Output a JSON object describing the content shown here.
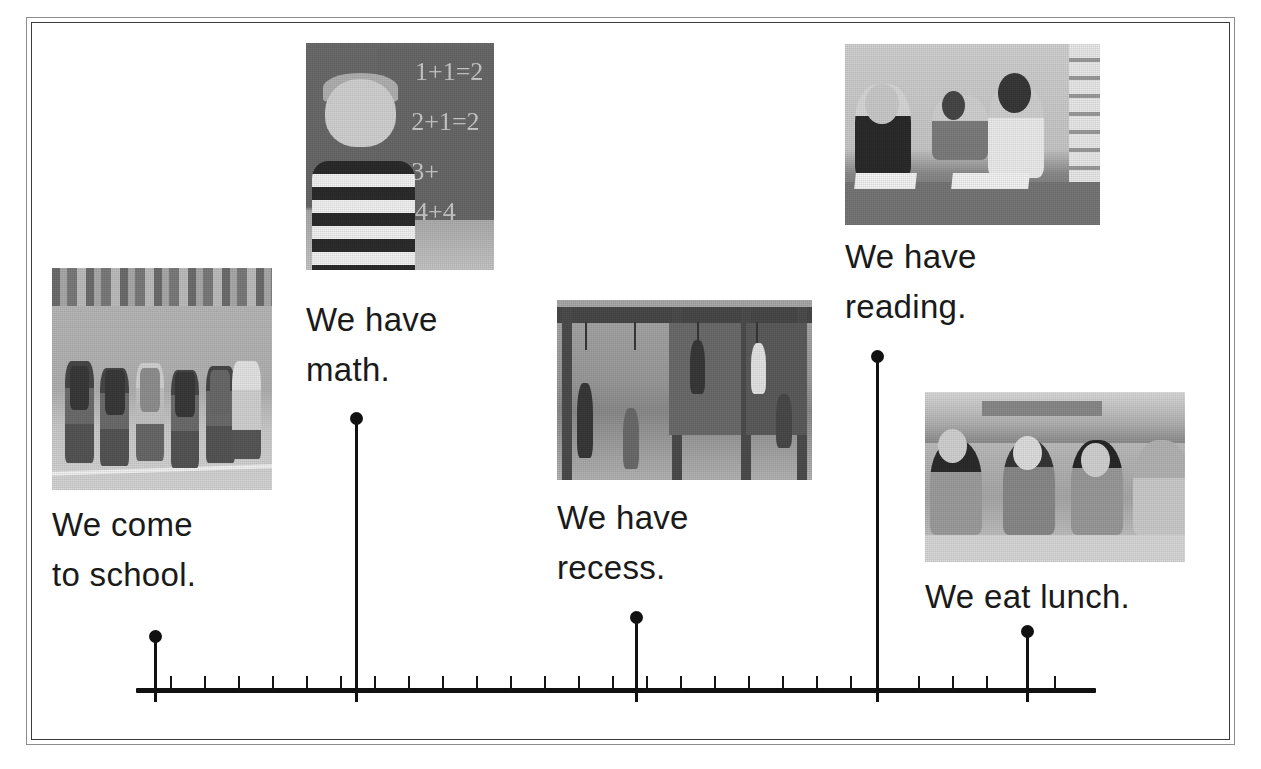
{
  "document": {
    "type": "timeline-worksheet",
    "title": "Our School Day Timeline",
    "frame": {
      "outer_color": "#8c8c8c",
      "inner_color": "#3a3a3a"
    }
  },
  "timeline": {
    "axis": {
      "color": "#111111",
      "start_x": 136,
      "end_x": 1096,
      "y": 690,
      "minor_tick_count": 27,
      "minor_tick_spacing": 34
    },
    "marker_color": "#111111",
    "events": [
      {
        "id": "come-to-school",
        "label": "We come\nto school.",
        "label_lines": [
          "We come",
          "to school."
        ],
        "marker_x": 154,
        "dot_y": 636,
        "stem_top": 636,
        "label_x": 52,
        "label_y": 500,
        "photo": {
          "name": "children-walking-to-school-photo",
          "alt": "Group of children with backpacks walking toward school",
          "x": 52,
          "y": 268,
          "w": 220,
          "h": 222
        }
      },
      {
        "id": "have-math",
        "label": "We have\nmath.",
        "label_lines": [
          "We have",
          "math."
        ],
        "marker_x": 355,
        "dot_y": 418,
        "stem_top": 418,
        "label_x": 306,
        "label_y": 295,
        "photo": {
          "name": "boy-at-chalkboard-math-photo",
          "alt": "Boy in striped shirt thinking in front of a chalkboard with addition problems",
          "x": 306,
          "y": 43,
          "w": 188,
          "h": 227
        }
      },
      {
        "id": "have-recess",
        "label": "We have\nrecess.",
        "label_lines": [
          "We have",
          "recess."
        ],
        "marker_x": 635,
        "dot_y": 617,
        "stem_top": 617,
        "label_x": 557,
        "label_y": 493,
        "photo": {
          "name": "playground-recess-photo",
          "alt": "Children playing on playground climbing rings",
          "x": 557,
          "y": 300,
          "w": 255,
          "h": 180
        }
      },
      {
        "id": "have-reading",
        "label": "We have\nreading.",
        "label_lines": [
          "We have",
          "reading."
        ],
        "marker_x": 876,
        "dot_y": 356,
        "stem_top": 356,
        "label_x": 845,
        "label_y": 232,
        "photo": {
          "name": "students-reading-books-photo",
          "alt": "Three students reading open books at a classroom table",
          "x": 845,
          "y": 44,
          "w": 255,
          "h": 181
        }
      },
      {
        "id": "eat-lunch",
        "label": "We eat lunch.",
        "label_lines": [
          "We eat lunch."
        ],
        "marker_x": 1026,
        "dot_y": 631,
        "stem_top": 631,
        "label_x": 925,
        "label_y": 572,
        "photo": {
          "name": "children-eating-lunch-photo",
          "alt": "Children smiling and eating lunch at a cafeteria table",
          "x": 925,
          "y": 392,
          "w": 260,
          "h": 170
        }
      }
    ]
  },
  "chalkboard_equations": [
    "1+1=2",
    "2+1=2",
    "3+",
    "4+4"
  ]
}
